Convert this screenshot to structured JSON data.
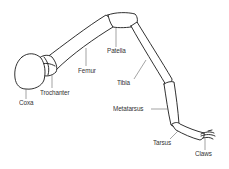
{
  "diagram": {
    "colors": {
      "outline": "#1a1a1a",
      "leader": "#555555",
      "label": "#333333",
      "background": "#ffffff"
    },
    "segments": [
      {
        "id": "coxa",
        "label": "Coxa"
      },
      {
        "id": "trochanter",
        "label": "Trochanter"
      },
      {
        "id": "femur",
        "label": "Femur"
      },
      {
        "id": "patella",
        "label": "Patella"
      },
      {
        "id": "tibia",
        "label": "Tibia"
      },
      {
        "id": "metatarsus",
        "label": "Metatarsus"
      },
      {
        "id": "tarsus",
        "label": "Tarsus"
      },
      {
        "id": "claws",
        "label": "Claws"
      }
    ]
  }
}
